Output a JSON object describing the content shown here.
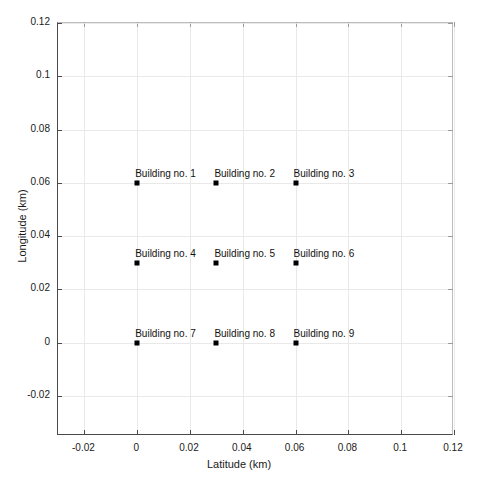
{
  "chart_data": {
    "type": "scatter",
    "title": "",
    "xlabel": "Latitude (km)",
    "ylabel": "Longitude (km)",
    "xlim": [
      -0.03,
      0.12
    ],
    "ylim": [
      -0.035,
      0.12
    ],
    "xticks": [
      -0.02,
      0,
      0.02,
      0.04,
      0.06,
      0.08,
      0.1,
      0.12
    ],
    "yticks": [
      -0.02,
      0,
      0.02,
      0.04,
      0.06,
      0.08,
      0.1,
      0.12
    ],
    "xticklabels": [
      "-0.02",
      "0",
      "0.02",
      "0.04",
      "0.06",
      "0.08",
      "0.1",
      "0.12"
    ],
    "yticklabels": [
      "-0.02",
      "0",
      "0.02",
      "0.04",
      "0.06",
      "0.08",
      "0.1",
      "0.12"
    ],
    "grid": true,
    "legend": "none",
    "marker": "square",
    "marker_color": "#000000",
    "grid_color": "#e9e9e9",
    "axis_color": "#4a4a4a",
    "points": [
      {
        "label": "Building no. 1",
        "x": 0,
        "y": 0.06
      },
      {
        "label": "Building no. 2",
        "x": 0.03,
        "y": 0.06
      },
      {
        "label": "Building no. 3",
        "x": 0.06,
        "y": 0.06
      },
      {
        "label": "Building no. 4",
        "x": 0,
        "y": 0.03
      },
      {
        "label": "Building no. 5",
        "x": 0.03,
        "y": 0.03
      },
      {
        "label": "Building no. 6",
        "x": 0.06,
        "y": 0.03
      },
      {
        "label": "Building no. 7",
        "x": 0,
        "y": 0
      },
      {
        "label": "Building no. 8",
        "x": 0.03,
        "y": 0
      },
      {
        "label": "Building no. 9",
        "x": 0.06,
        "y": 0
      }
    ]
  }
}
